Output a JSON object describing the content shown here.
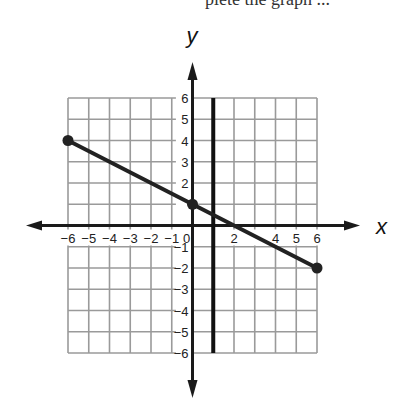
{
  "header": {
    "cut_text": "plete the graph ..."
  },
  "chart_data": {
    "type": "line",
    "title": "",
    "xlabel": "x",
    "ylabel": "y",
    "xlim": [
      -6,
      6
    ],
    "ylim": [
      -6,
      6
    ],
    "grid": true,
    "x_ticks": [
      "-6",
      "-5",
      "-4",
      "-3",
      "-2",
      "-1",
      "0",
      "2",
      "4",
      "5",
      "6"
    ],
    "y_ticks": [
      "6",
      "5",
      "4",
      "3",
      "2",
      "-1",
      "-2",
      "-3",
      "-4",
      "-5",
      "-6"
    ],
    "series": [
      {
        "name": "line segment",
        "points": [
          [
            -6,
            4
          ],
          [
            0,
            1
          ],
          [
            6,
            -2
          ]
        ],
        "endpoints_marked": true,
        "color": "#222222"
      }
    ],
    "vertical_lines": [
      {
        "x": 1,
        "ymin": -6,
        "ymax": 6,
        "color": "#111111"
      }
    ]
  }
}
